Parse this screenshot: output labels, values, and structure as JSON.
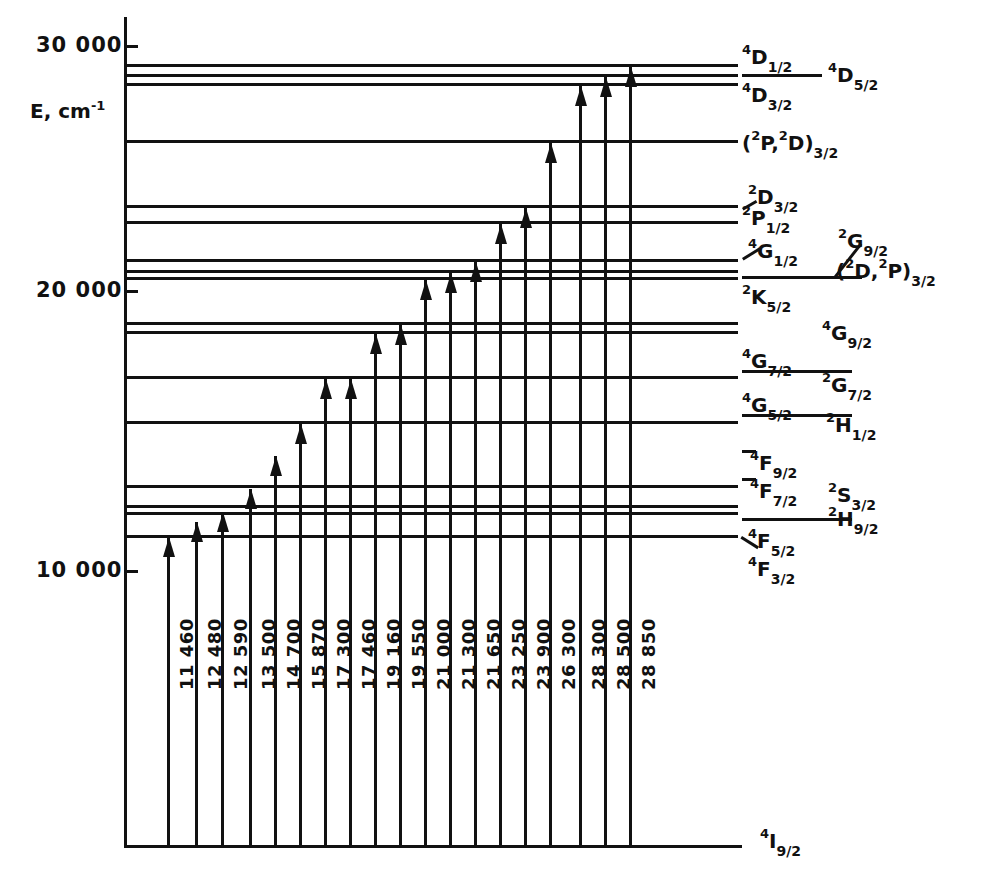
{
  "figure": {
    "type": "energy-level-diagram",
    "axis": {
      "title": "E, cm",
      "title_exponent": "-1",
      "ticks": [
        "30 000",
        "20 000",
        "10 000"
      ],
      "tick_values": [
        30000,
        20000,
        10000
      ]
    },
    "ground_state_label_pre": "4",
    "ground_state_label_main": "I",
    "ground_state_label_sub": "9/2"
  },
  "chart_data": {
    "type": "line",
    "xlabel": "",
    "ylabel": "E, cm-1",
    "ylim": [
      0,
      31000
    ],
    "axis_ticks": [
      30000,
      20000,
      10000
    ],
    "grid": false,
    "legend": "none",
    "transitions": {
      "name": "Pump transition wavenumbers (cm-1)",
      "labels": [
        "11 460",
        "12 480",
        "12 590",
        "13 500",
        "14 700",
        "15 870",
        "17 300",
        "17 460",
        "19 160",
        "19 550",
        "21 000",
        "21 300",
        "21 650",
        "23 250",
        "23 900",
        "26 300",
        "28 300",
        "28 500",
        "28 850"
      ],
      "values": [
        11460,
        12480,
        12590,
        13500,
        14700,
        15870,
        17300,
        17460,
        19160,
        19550,
        21000,
        21300,
        21650,
        23250,
        23900,
        26300,
        28300,
        28500,
        28850
      ]
    },
    "levels": [
      {
        "energy": 28850,
        "label_pre": "4",
        "label_main": "D",
        "label_sub": "1/2"
      },
      {
        "energy": 28500,
        "label_pre": "4",
        "label_main": "D",
        "label_sub": "5/2"
      },
      {
        "energy": 28300,
        "label_pre": "4",
        "label_main": "D",
        "label_sub": "3/2"
      },
      {
        "energy": 26300,
        "label_pre": "2",
        "label_main": "(  P,  D)",
        "label_sub": "3/2"
      },
      {
        "energy": 23900,
        "label_pre": "2",
        "label_main": "D",
        "label_sub": "3/2"
      },
      {
        "energy": 23250,
        "label_pre": "2",
        "label_main": "P",
        "label_sub": "1/2"
      },
      {
        "energy": 21650,
        "label_pre": "4",
        "label_main": "G",
        "label_sub": "1/2"
      },
      {
        "energy": 21300,
        "label_pre": "2",
        "label_main": "G",
        "label_sub": "9/2"
      },
      {
        "energy": 21000,
        "label_pre": "2",
        "label_main": "K",
        "label_sub": "5/2"
      },
      {
        "energy": 19550,
        "label_pre": "4",
        "label_main": "G",
        "label_sub": "9/2"
      },
      {
        "energy": 19160,
        "label_pre": "4",
        "label_main": "G",
        "label_sub": "7/2"
      },
      {
        "energy": 17460,
        "label_pre": "2",
        "label_main": "G",
        "label_sub": "7/2"
      },
      {
        "energy": 17300,
        "label_pre": "4",
        "label_main": "G",
        "label_sub": "5/2"
      },
      {
        "energy": 15870,
        "label_pre": "2",
        "label_main": "H",
        "label_sub": "1/2"
      },
      {
        "energy": 14700,
        "label_pre": "4",
        "label_main": "F",
        "label_sub": "9/2"
      },
      {
        "energy": 13500,
        "label_pre": "4",
        "label_main": "F",
        "label_sub": "7/2"
      },
      {
        "energy": 12590,
        "label_pre": "2",
        "label_main": "S",
        "label_sub": "3/2"
      },
      {
        "energy": 12480,
        "label_pre": "2",
        "label_main": "H",
        "label_sub": "9/2"
      },
      {
        "energy": 11460,
        "label_pre": "4",
        "label_main": "F",
        "label_sub": "5/2"
      },
      {
        "energy": 11000,
        "label_pre": "4",
        "label_main": "F",
        "label_sub": "3/2"
      },
      {
        "energy": 0,
        "label_pre": "4",
        "label_main": "I",
        "label_sub": "9/2"
      }
    ]
  },
  "level_lines": [
    {
      "y": 64,
      "x1": 124,
      "x2": 738
    },
    {
      "y": 74,
      "x1": 124,
      "x2": 738
    },
    {
      "y": 83,
      "x1": 124,
      "x2": 738
    },
    {
      "y": 140,
      "x1": 124,
      "x2": 738
    },
    {
      "y": 205,
      "x1": 124,
      "x2": 738
    },
    {
      "y": 221,
      "x1": 124,
      "x2": 738
    },
    {
      "y": 259,
      "x1": 124,
      "x2": 738
    },
    {
      "y": 270,
      "x1": 124,
      "x2": 738
    },
    {
      "y": 277,
      "x1": 124,
      "x2": 738
    },
    {
      "y": 322,
      "x1": 124,
      "x2": 738
    },
    {
      "y": 331,
      "x1": 124,
      "x2": 738
    },
    {
      "y": 376,
      "x1": 124,
      "x2": 738
    },
    {
      "y": 421,
      "x1": 124,
      "x2": 738
    },
    {
      "y": 485,
      "x1": 124,
      "x2": 738
    },
    {
      "y": 505,
      "x1": 124,
      "x2": 738
    },
    {
      "y": 512,
      "x1": 124,
      "x2": 738
    },
    {
      "y": 535,
      "x1": 124,
      "x2": 738
    },
    {
      "y": 845,
      "x1": 124,
      "x2": 740
    }
  ],
  "transition_lines": [
    {
      "x": 167,
      "top": 537,
      "label": "11 460"
    },
    {
      "x": 195,
      "top": 522,
      "label": "12 480"
    },
    {
      "x": 221,
      "top": 512,
      "label": "12 590"
    },
    {
      "x": 249,
      "top": 489,
      "label": "13 500"
    },
    {
      "x": 274,
      "top": 456,
      "label": "14 700"
    },
    {
      "x": 299,
      "top": 424,
      "label": "15 870"
    },
    {
      "x": 324,
      "top": 379,
      "label": "17 300"
    },
    {
      "x": 349,
      "top": 379,
      "label": "17 460"
    },
    {
      "x": 374,
      "top": 334,
      "label": "19 160"
    },
    {
      "x": 399,
      "top": 325,
      "label": "19 550"
    },
    {
      "x": 424,
      "top": 280,
      "label": "21 000"
    },
    {
      "x": 449,
      "top": 273,
      "label": "21 300"
    },
    {
      "x": 474,
      "top": 262,
      "label": "21 650"
    },
    {
      "x": 499,
      "top": 224,
      "label": "23 250"
    },
    {
      "x": 524,
      "top": 208,
      "label": "23 900"
    },
    {
      "x": 549,
      "top": 143,
      "label": "26 300"
    },
    {
      "x": 579,
      "top": 86,
      "label": "28 300"
    },
    {
      "x": 604,
      "top": 77,
      "label": "28 500"
    },
    {
      "x": 629,
      "top": 67,
      "label": "28 850"
    }
  ],
  "axis_labels": [
    {
      "text": "30 000",
      "y": 33,
      "x": 36
    },
    {
      "text": "20 000",
      "y": 278,
      "x": 36
    },
    {
      "text": "10 000",
      "y": 548,
      "x": 36
    }
  ],
  "term_labels": [
    {
      "pre": "4",
      "main": "D",
      "sub": "1/2",
      "x": 742,
      "y": 44
    },
    {
      "pre": "4",
      "main": "D",
      "sub": "5/2",
      "x": 828,
      "y": 62
    },
    {
      "pre": "4",
      "main": "D",
      "sub": "3/2",
      "x": 742,
      "y": 82
    },
    {
      "pre": "",
      "main": "(",
      "sub": "",
      "x": 742,
      "y": 130
    },
    {
      "pre": "2",
      "main": "D",
      "sub": "3/2",
      "x": 748,
      "y": 184
    },
    {
      "pre": "2",
      "main": "P",
      "sub": "1/2",
      "x": 742,
      "y": 205
    },
    {
      "pre": "4",
      "main": "G",
      "sub": "1/2",
      "x": 748,
      "y": 238
    },
    {
      "pre": "2",
      "main": "G",
      "sub": "9/2",
      "x": 838,
      "y": 228
    },
    {
      "pre": "2",
      "main": "K",
      "sub": "5/2",
      "x": 742,
      "y": 284
    },
    {
      "pre": "4",
      "main": "G",
      "sub": "9/2",
      "x": 822,
      "y": 320
    },
    {
      "pre": "4",
      "main": "G",
      "sub": "7/2",
      "x": 742,
      "y": 348
    },
    {
      "pre": "2",
      "main": "G",
      "sub": "7/2",
      "x": 822,
      "y": 372
    },
    {
      "pre": "4",
      "main": "G",
      "sub": "5/2",
      "x": 742,
      "y": 392
    },
    {
      "pre": "2",
      "main": "H",
      "sub": "1/2",
      "x": 826,
      "y": 412
    },
    {
      "pre": "4",
      "main": "F",
      "sub": "9/2",
      "x": 750,
      "y": 450
    },
    {
      "pre": "4",
      "main": "F",
      "sub": "7/2",
      "x": 750,
      "y": 478
    },
    {
      "pre": "2",
      "main": "S",
      "sub": "3/2",
      "x": 828,
      "y": 482
    },
    {
      "pre": "2",
      "main": "H",
      "sub": "9/2",
      "x": 828,
      "y": 506
    },
    {
      "pre": "4",
      "main": "F",
      "sub": "5/2",
      "x": 748,
      "y": 528
    },
    {
      "pre": "4",
      "main": "F",
      "sub": "3/2",
      "x": 748,
      "y": 556
    },
    {
      "pre": "4",
      "main": "I",
      "sub": "9/2",
      "x": 760,
      "y": 828
    }
  ],
  "composite_labels": {
    "pd32": {
      "open": "(",
      "pre1": "2",
      "m1": "P,",
      "pre2": "2",
      "m2": "D)",
      "sub": "3/2"
    },
    "d2p32": {
      "open": "(",
      "pre1": "2",
      "m1": "D,",
      "pre2": "2",
      "m2": "P)",
      "sub": "3/2"
    }
  }
}
